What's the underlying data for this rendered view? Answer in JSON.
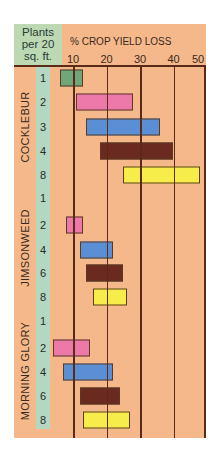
{
  "chart_data": {
    "type": "bar",
    "subtype": "floating-range",
    "title": "% CROP YIELD LOSS",
    "row_header": "Plants per 20 sq. ft.",
    "xlabel": "% CROP YIELD LOSS",
    "xticks": [
      10,
      20,
      30,
      40,
      50
    ],
    "xlim": [
      4,
      50
    ],
    "grid": true,
    "colors": {
      "1": "#6fa67a",
      "2": "#ec79a8",
      "3": "#5a8fd6",
      "4": "#6a2a20",
      "6": "#6a2a20",
      "8": "#f6ec4a"
    },
    "groups": [
      {
        "species": "COCKLEBUR",
        "rows": [
          {
            "density": "1",
            "min": 6,
            "max": 13,
            "color": "#6fa67a"
          },
          {
            "density": "2",
            "min": 11,
            "max": 28,
            "color": "#ec79a8"
          },
          {
            "density": "3",
            "min": 14,
            "max": 36,
            "color": "#5a8fd6"
          },
          {
            "density": "4",
            "min": 18,
            "max": 40,
            "color": "#6a2a20"
          },
          {
            "density": "8",
            "min": 25,
            "max": 48,
            "color": "#f6ec4a"
          }
        ]
      },
      {
        "species": "JIMSONWEED",
        "rows": [
          {
            "density": "1",
            "min": null,
            "max": null,
            "color": null
          },
          {
            "density": "2",
            "min": 8,
            "max": 13,
            "color": "#ec79a8"
          },
          {
            "density": "4",
            "min": 12,
            "max": 22,
            "color": "#5a8fd6"
          },
          {
            "density": "6",
            "min": 14,
            "max": 25,
            "color": "#6a2a20"
          },
          {
            "density": "8",
            "min": 16,
            "max": 26,
            "color": "#f6ec4a"
          }
        ]
      },
      {
        "species": "MORNING GLORY",
        "rows": [
          {
            "density": "1",
            "min": null,
            "max": null,
            "color": null
          },
          {
            "density": "2",
            "min": 4,
            "max": 15,
            "color": "#ec79a8"
          },
          {
            "density": "4",
            "min": 7,
            "max": 22,
            "color": "#5a8fd6"
          },
          {
            "density": "6",
            "min": 12,
            "max": 24,
            "color": "#6a2a20"
          },
          {
            "density": "8",
            "min": 13,
            "max": 27,
            "color": "#f6ec4a"
          }
        ]
      }
    ]
  },
  "header": {
    "row_header_lines": [
      "Plants",
      "per 20",
      "sq. ft."
    ],
    "axis_title": "% CROP YIELD LOSS",
    "ticks": [
      "10",
      "20",
      "30",
      "40",
      "50"
    ]
  }
}
